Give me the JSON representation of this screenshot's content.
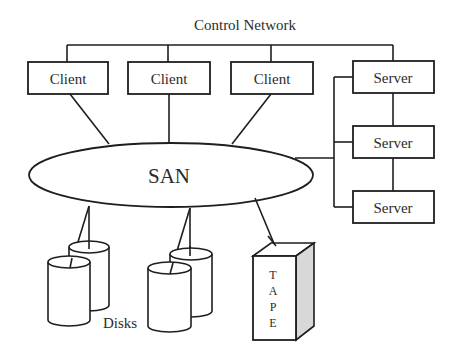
{
  "title": "Control Network",
  "san": {
    "label": "SAN"
  },
  "clients": [
    {
      "label": "Client"
    },
    {
      "label": "Client"
    },
    {
      "label": "Client"
    }
  ],
  "servers": [
    {
      "label": "Server"
    },
    {
      "label": "Server"
    },
    {
      "label": "Server"
    }
  ],
  "storage": {
    "disks_label": "Disks",
    "tape_letters": [
      "T",
      "A",
      "P",
      "E"
    ]
  },
  "colors": {
    "stroke": "#1e1e1e",
    "text": "#2b2b2b",
    "tape_side": "#d8d8d8",
    "background": "#ffffff"
  }
}
